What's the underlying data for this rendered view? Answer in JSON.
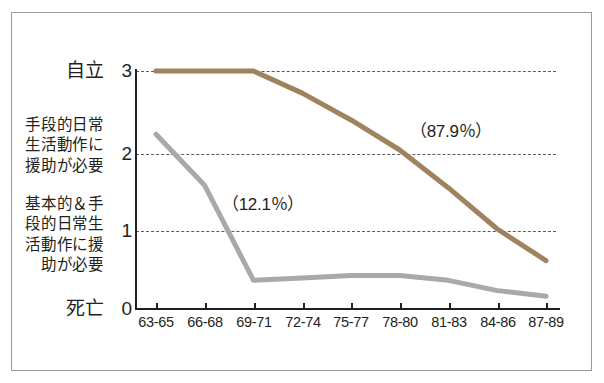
{
  "chart_data": {
    "type": "line",
    "title": "",
    "xlabel": "",
    "ylabel": "",
    "categories": [
      "63-65",
      "66-68",
      "69-71",
      "72-74",
      "75-77",
      "78-80",
      "81-83",
      "84-86",
      "87-89"
    ],
    "ylim": [
      0,
      3
    ],
    "xlim_categories": 9,
    "grid": "horizontal-dashed-at-1-2-3",
    "legend": "none",
    "y_tick_values": [
      "3",
      "2",
      "1",
      "0"
    ],
    "y_tick_labels": [
      "自立",
      "手段的日常\n生活動作に\n援助が必要",
      "基本的＆手\n段的日常生\n活動作に援\n助が必要",
      "死亡"
    ],
    "series": [
      {
        "name": "brown-series",
        "color": "#a0825f",
        "annotation": "（87.9％）",
        "values": [
          3.0,
          3.0,
          3.0,
          2.72,
          2.38,
          2.0,
          1.52,
          1.0,
          0.6
        ]
      },
      {
        "name": "gray-series",
        "color": "#a9a9a9",
        "annotation": "（12.1％）",
        "values": [
          2.2,
          1.55,
          0.35,
          0.38,
          0.41,
          0.41,
          0.35,
          0.22,
          0.15
        ]
      }
    ],
    "annotations": [
      {
        "text": "（87.9％）",
        "near_series": "brown-series"
      },
      {
        "text": "（12.1％）",
        "near_series": "gray-series"
      }
    ]
  },
  "axis": {
    "y": {
      "ticks": [
        {
          "value": "3",
          "label": "自立"
        },
        {
          "value": "2",
          "label": "手段的日常\n生活動作に\n援助が必要"
        },
        {
          "value": "1",
          "label": "基本的＆手\n段的日常生\n活動作に援\n助が必要"
        },
        {
          "value": "0",
          "label": "死亡"
        }
      ]
    },
    "x": {
      "ticks": [
        "63-65",
        "66-68",
        "69-71",
        "72-74",
        "75-77",
        "78-80",
        "81-83",
        "84-86",
        "87-89"
      ]
    }
  },
  "colors": {
    "brown_line": "#a0825f",
    "gray_line": "#a9a9a9",
    "axis": "#231f20",
    "gridline": "#5a5a5a",
    "frame": "#9a9a9a",
    "background": "#ffffff"
  }
}
